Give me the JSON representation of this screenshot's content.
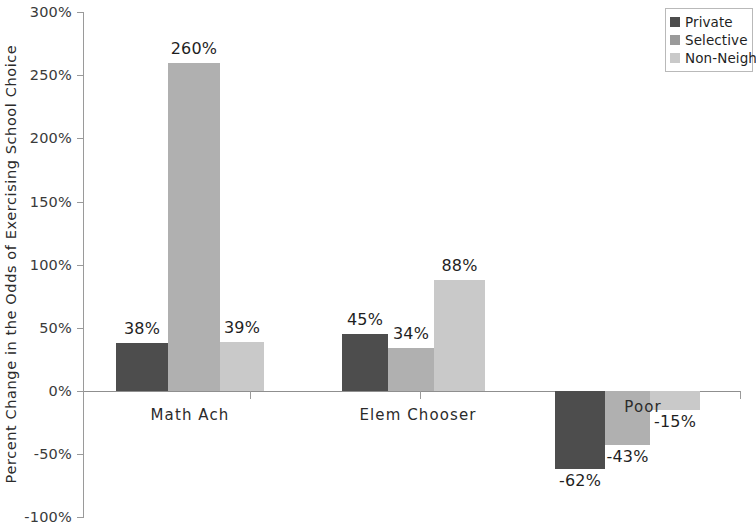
{
  "chart_data": {
    "type": "bar",
    "title": "",
    "xlabel": "",
    "ylabel": "Percent Change in the Odds of Exercising School Choice",
    "categories": [
      "Math Ach",
      "Elem Chooser",
      "Poor"
    ],
    "series": [
      {
        "name": "Private",
        "values": [
          38,
          45,
          -62
        ]
      },
      {
        "name": "Selective",
        "values": [
          260,
          34,
          -43
        ]
      },
      {
        "name": "Non-Neigh",
        "values": [
          39,
          88,
          -15
        ]
      }
    ],
    "value_labels": [
      [
        "38%",
        "260%",
        "39%"
      ],
      [
        "45%",
        "34%",
        "88%"
      ],
      [
        "-62%",
        "-43%",
        "-15%"
      ]
    ],
    "ylim": [
      -100,
      300
    ],
    "ytick_labels": [
      "300%",
      "250%",
      "200%",
      "150%",
      "100%",
      "50%",
      "0%",
      "-50%",
      "-100%"
    ],
    "ytick_values": [
      300,
      250,
      200,
      150,
      100,
      50,
      0,
      -50,
      -100
    ],
    "grid": false,
    "legend_position": "top-right",
    "legend_entries": [
      "Private",
      "Selective",
      "Non-Neigh"
    ],
    "colors": {
      "series_0": "#4d4d4d",
      "series_1": "#b0b0b0",
      "series_2": "#c9c9c9",
      "axis": "#9a9a9a",
      "text": "#1f1f1f",
      "background": "#ffffff"
    }
  },
  "legend": {
    "items": [
      {
        "label": "Private",
        "color": "#4d4d4d"
      },
      {
        "label": "Selective",
        "color": "#9a9a9a"
      },
      {
        "label": "Non-Neigh",
        "color": "#c9c9c9"
      }
    ]
  }
}
